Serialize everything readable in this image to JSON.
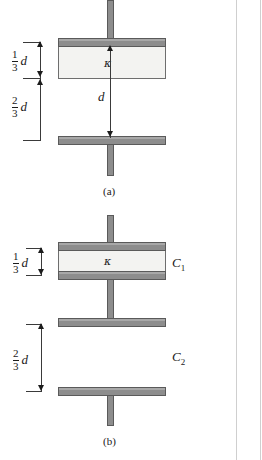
{
  "figure": {
    "panels": [
      {
        "id": "a",
        "caption": "(a)",
        "dielectric_symbol": "κ",
        "gap_label": "d",
        "dimensions": [
          {
            "name": "upper",
            "numerator": "1",
            "denominator": "3",
            "variable": "d"
          },
          {
            "name": "lower",
            "numerator": "2",
            "denominator": "3",
            "variable": "d"
          }
        ]
      },
      {
        "id": "b",
        "caption": "(b)",
        "dielectric_symbol": "κ",
        "capacitor_labels": [
          {
            "base": "C",
            "sub": "1"
          },
          {
            "base": "C",
            "sub": "2"
          }
        ],
        "dimensions": [
          {
            "name": "upper",
            "numerator": "1",
            "denominator": "3",
            "variable": "d"
          },
          {
            "name": "lower",
            "numerator": "2",
            "denominator": "3",
            "variable": "d"
          }
        ]
      }
    ]
  },
  "colors": {
    "plate_fill": "#8d8d8d",
    "plate_edge": "#5a5a5a",
    "dielectric_fill": "#f3f3f1",
    "dimension_line": "#3a3a3a",
    "page_rule": "#cfcfcf",
    "background": "#ffffff"
  }
}
